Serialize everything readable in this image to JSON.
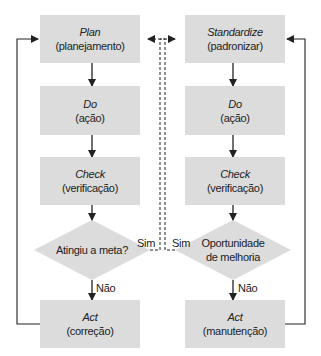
{
  "diagram": {
    "left_cycle": {
      "plan": {
        "title": "Plan",
        "subtitle": "(planejamento)"
      },
      "do": {
        "title": "Do",
        "subtitle": "(ação)"
      },
      "check": {
        "title": "Check",
        "subtitle": "(verificação)"
      },
      "decision": "Atingiu a meta?",
      "yes_label": "Sim",
      "no_label": "Não",
      "act": {
        "title": "Act",
        "subtitle": "(correção)"
      }
    },
    "right_cycle": {
      "standardize": {
        "title": "Standardize",
        "subtitle": "(padronizar)"
      },
      "do": {
        "title": "Do",
        "subtitle": "(ação)"
      },
      "check": {
        "title": "Check",
        "subtitle": "(verificação)"
      },
      "decision_line1": "Oportunidade",
      "decision_line2": "de melhoria",
      "yes_label": "Sim",
      "no_label": "Não",
      "act": {
        "title": "Act",
        "subtitle": "(manutenção)"
      }
    },
    "colors": {
      "box_fill": "#dcdcdc",
      "line": "#222222",
      "background": "#ffffff"
    }
  }
}
